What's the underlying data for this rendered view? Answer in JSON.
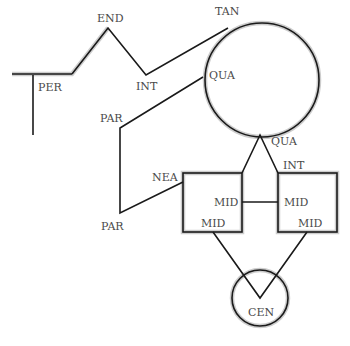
{
  "diagram": {
    "type": "geometric-relations",
    "labels": {
      "end": "END",
      "tan": "TAN",
      "per": "PER",
      "int_top": "INT",
      "qua_left": "QUA",
      "par_top": "PAR",
      "qua_bottom": "QUA",
      "int_right": "INT",
      "nea": "NEA",
      "mid_left_square_right": "MID",
      "mid_right_square_left": "MID",
      "par_bottom": "PAR",
      "mid_left_square_bottom": "MID",
      "mid_right_square_bottom": "MID",
      "cen": "CEN"
    },
    "shapes": [
      {
        "name": "large-circle",
        "kind": "circle"
      },
      {
        "name": "left-square",
        "kind": "square"
      },
      {
        "name": "right-square",
        "kind": "square"
      },
      {
        "name": "small-circle",
        "kind": "circle"
      }
    ],
    "colors": {
      "stroke": "#1a1a1a",
      "halo": "#b8b8b8",
      "label": "#4a4a4a"
    }
  }
}
